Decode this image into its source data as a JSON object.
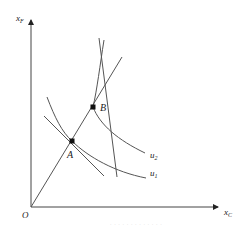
{
  "diagram": {
    "axes": {
      "y_label": "x",
      "y_label_sub": "F",
      "x_label": "x",
      "x_label_sub": "C",
      "origin_label": "O"
    },
    "points": [
      {
        "name": "A",
        "label": "A"
      },
      {
        "name": "B",
        "label": "B"
      }
    ],
    "curves": [
      {
        "name": "u1",
        "label": "u",
        "label_sub": "1"
      },
      {
        "name": "u2",
        "label": "u",
        "label_sub": "2"
      }
    ],
    "colors": {
      "line": "#555555",
      "axis": "#444444",
      "point": "#111111",
      "caption": "#d6d6d6"
    },
    "caption": "· · · · · · · ·  · · · · ·"
  }
}
